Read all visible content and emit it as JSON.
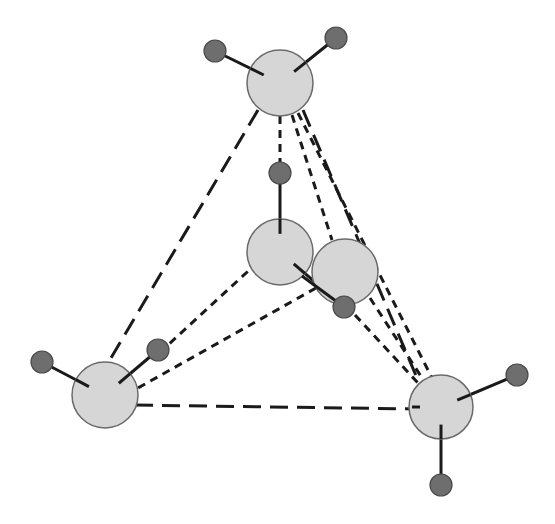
{
  "diagram": {
    "title": "",
    "colors": {
      "oxygen_fill": "#d6d6d6",
      "oxygen_stroke": "#6a6a6a",
      "hydrogen_fill": "#6e6e6e",
      "hydrogen_stroke": "#4a4a4a",
      "bond": "#1a1a1a",
      "dash": "#1a1a1a"
    },
    "oxygens": [
      {
        "id": "top",
        "cx": 280,
        "cy": 83,
        "r": 33
      },
      {
        "id": "center-left",
        "cx": 280,
        "cy": 252,
        "r": 33
      },
      {
        "id": "center-right",
        "cx": 345,
        "cy": 272,
        "r": 33
      },
      {
        "id": "bottom-left",
        "cx": 105,
        "cy": 395,
        "r": 33
      },
      {
        "id": "bottom-right",
        "cx": 441,
        "cy": 407,
        "r": 32
      }
    ],
    "hydrogens": [
      {
        "id": "top-h1",
        "cx": 215,
        "cy": 51,
        "r": 11,
        "bonded_to": "top"
      },
      {
        "id": "top-h2",
        "cx": 336,
        "cy": 38,
        "r": 11,
        "bonded_to": "top"
      },
      {
        "id": "center-left-h1",
        "cx": 280,
        "cy": 173,
        "r": 11,
        "bonded_to": "center-left"
      },
      {
        "id": "center-left-h2",
        "cx": 344,
        "cy": 307,
        "r": 11,
        "bonded_to": "center-left"
      },
      {
        "id": "bottom-left-h1",
        "cx": 42,
        "cy": 362,
        "r": 11,
        "bonded_to": "bottom-left"
      },
      {
        "id": "bottom-left-h2",
        "cx": 158,
        "cy": 350,
        "r": 11,
        "bonded_to": "bottom-left"
      },
      {
        "id": "bottom-right-h1",
        "cx": 517,
        "cy": 375,
        "r": 11,
        "bonded_to": "bottom-right"
      },
      {
        "id": "bottom-right-h2",
        "cx": 441,
        "cy": 485,
        "r": 11,
        "bonded_to": "bottom-right"
      }
    ],
    "long_dashes": [
      {
        "x1": 258,
        "y1": 110,
        "x2": 108,
        "y2": 363
      },
      {
        "x1": 135,
        "y1": 405,
        "x2": 420,
        "y2": 409
      },
      {
        "x1": 303,
        "y1": 110,
        "x2": 420,
        "y2": 385
      }
    ],
    "short_dashes": [
      {
        "x1": 280,
        "y1": 116,
        "x2": 280,
        "y2": 162
      },
      {
        "x1": 292,
        "y1": 115,
        "x2": 332,
        "y2": 240
      },
      {
        "x1": 298,
        "y1": 113,
        "x2": 432,
        "y2": 378
      },
      {
        "x1": 258,
        "y1": 262,
        "x2": 168,
        "y2": 345
      },
      {
        "x1": 316,
        "y1": 288,
        "x2": 138,
        "y2": 388
      },
      {
        "x1": 370,
        "y1": 298,
        "x2": 424,
        "y2": 381
      },
      {
        "x1": 355,
        "y1": 315,
        "x2": 418,
        "y2": 383
      }
    ],
    "inner_tick": {
      "x1": 412,
      "y1": 407,
      "x2": 420,
      "y2": 407
    }
  }
}
